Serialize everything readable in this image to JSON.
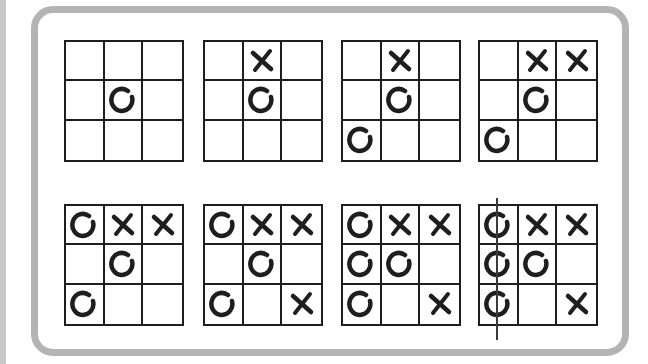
{
  "colors": {
    "ink": "#1e1e1e",
    "frame": "#b4b4b4",
    "background": "#ffffff"
  },
  "boards": [
    {
      "step": 1,
      "cells": [
        "",
        "",
        "",
        "",
        "O",
        "",
        "",
        "",
        ""
      ]
    },
    {
      "step": 2,
      "cells": [
        "",
        "X",
        "",
        "",
        "O",
        "",
        "",
        "",
        ""
      ]
    },
    {
      "step": 3,
      "cells": [
        "",
        "X",
        "",
        "",
        "O",
        "",
        "O",
        "",
        ""
      ]
    },
    {
      "step": 4,
      "cells": [
        "",
        "X",
        "X",
        "",
        "O",
        "",
        "O",
        "",
        ""
      ]
    },
    {
      "step": 5,
      "cells": [
        "O",
        "X",
        "X",
        "",
        "O",
        "",
        "O",
        "",
        ""
      ]
    },
    {
      "step": 6,
      "cells": [
        "O",
        "X",
        "X",
        "",
        "O",
        "",
        "O",
        "",
        "X"
      ]
    },
    {
      "step": 7,
      "cells": [
        "O",
        "X",
        "X",
        "O",
        "O",
        "",
        "O",
        "",
        "X"
      ]
    },
    {
      "step": 8,
      "cells": [
        "O",
        "X",
        "X",
        "O",
        "O",
        "",
        "O",
        "",
        "X"
      ],
      "win_line": "left-column",
      "winner": "O"
    }
  ]
}
